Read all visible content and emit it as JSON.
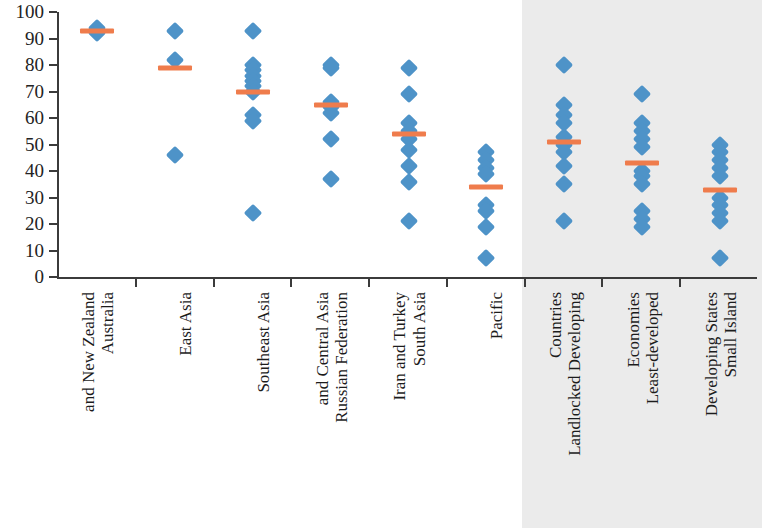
{
  "chart_data": {
    "type": "scatter",
    "title": "",
    "xlabel": "",
    "ylabel": "",
    "ylim": [
      0,
      100
    ],
    "ytick_labels": [
      "0",
      "10",
      "20",
      "30",
      "40",
      "50",
      "60",
      "70",
      "80",
      "90",
      "100"
    ],
    "yticks": [
      0,
      10,
      20,
      30,
      40,
      50,
      60,
      70,
      80,
      90,
      100
    ],
    "grid": false,
    "legend": "none",
    "marker_color": "#4e93c8",
    "mean_color": "#ef7c4c",
    "shaded_panel_color": "#ebebeb",
    "shaded_groups_note": "Last three categories are drawn on a grey shaded background panel",
    "categories": [
      "Australia and New Zealand",
      "East Asia",
      "Southeast Asia",
      "Russian Federation and Central Asia",
      "South Asia Iran and Turkey",
      "Pacific",
      "Landlocked Developing Countries",
      "Least-developed Economies",
      "Small Island Developing States"
    ],
    "category_label_lines": [
      [
        "Australia",
        "and New Zealand"
      ],
      [
        "East Asia"
      ],
      [
        "Southeast Asia"
      ],
      [
        "Russian Federation",
        "and Central Asia"
      ],
      [
        "South Asia",
        "Iran and Turkey"
      ],
      [
        "Pacific"
      ],
      [
        "Landlocked Developing",
        "Countries"
      ],
      [
        "Least-developed",
        "Economies"
      ],
      [
        "Small Island",
        "Developing States"
      ]
    ],
    "groups": [
      {
        "name": "Australia and New Zealand",
        "shaded": false,
        "values": [
          94,
          92
        ],
        "mean": 93
      },
      {
        "name": "East Asia",
        "shaded": false,
        "values": [
          93,
          82,
          46
        ],
        "mean": 79
      },
      {
        "name": "Southeast Asia",
        "shaded": false,
        "values": [
          93,
          80,
          78,
          76,
          74,
          72,
          70,
          61,
          59,
          24
        ],
        "mean": 70
      },
      {
        "name": "Russian Federation and Central Asia",
        "shaded": false,
        "values": [
          80,
          79,
          66,
          64,
          62,
          52,
          37
        ],
        "mean": 65
      },
      {
        "name": "South Asia Iran and Turkey",
        "shaded": false,
        "values": [
          79,
          69,
          58,
          55,
          52,
          48,
          42,
          36,
          21
        ],
        "mean": 54
      },
      {
        "name": "Pacific",
        "shaded": false,
        "values": [
          47,
          44,
          41,
          39,
          27,
          25,
          19,
          7
        ],
        "mean": 34
      },
      {
        "name": "Landlocked Developing Countries",
        "shaded": true,
        "values": [
          80,
          65,
          61,
          58,
          53,
          50,
          47,
          42,
          35,
          21
        ],
        "mean": 51
      },
      {
        "name": "Least-developed Economies",
        "shaded": true,
        "values": [
          69,
          58,
          55,
          52,
          49,
          40,
          38,
          35,
          25,
          22,
          19
        ],
        "mean": 43
      },
      {
        "name": "Small Island Developing States",
        "shaded": true,
        "values": [
          50,
          47,
          44,
          41,
          38,
          30,
          27,
          24,
          21,
          7
        ],
        "mean": 33
      }
    ]
  }
}
